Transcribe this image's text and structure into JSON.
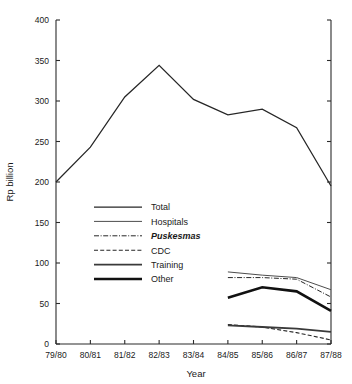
{
  "chart_data": {
    "type": "line",
    "title": "",
    "xlabel": "Year",
    "ylabel": "Rp billion",
    "ylim": [
      0,
      400
    ],
    "yticks": [
      0,
      50,
      100,
      150,
      200,
      250,
      300,
      350,
      400
    ],
    "ytick_labels": [
      "0",
      "50",
      "100",
      "150",
      "200",
      "250",
      "300",
      "350",
      "400"
    ],
    "categories": [
      "79/80",
      "80/81",
      "81/82",
      "82/83",
      "83/84",
      "84/85",
      "85/86",
      "86/87",
      "87/88"
    ],
    "grid": false,
    "legend_position": "center-left",
    "series": [
      {
        "name": "Total",
        "style": "solid-thin",
        "x": [
          "79/80",
          "80/81",
          "81/82",
          "82/83",
          "83/84",
          "84/85",
          "85/86",
          "86/87",
          "87/88"
        ],
        "values": [
          200,
          243,
          305,
          344,
          302,
          283,
          290,
          267,
          195
        ]
      },
      {
        "name": "Hospitals",
        "style": "solid-light",
        "x": [
          "84/85",
          "85/86",
          "86/87",
          "87/88"
        ],
        "values": [
          89,
          85,
          82,
          67
        ]
      },
      {
        "name": "Puskesmas",
        "style": "dash-dot",
        "italic": true,
        "x": [
          "84/85",
          "85/86",
          "86/87",
          "87/88"
        ],
        "values": [
          82,
          82,
          80,
          58
        ]
      },
      {
        "name": "CDC",
        "style": "dashed",
        "x": [
          "84/85",
          "85/86",
          "86/87",
          "87/88"
        ],
        "values": [
          24,
          21,
          14,
          5
        ]
      },
      {
        "name": "Training",
        "style": "solid-medium",
        "x": [
          "84/85",
          "85/86",
          "86/87",
          "87/88"
        ],
        "values": [
          23,
          21,
          19,
          15
        ]
      },
      {
        "name": "Other",
        "style": "solid-thick",
        "x": [
          "84/85",
          "85/86",
          "86/87",
          "87/88"
        ],
        "values": [
          57,
          70,
          65,
          41
        ]
      }
    ],
    "legend_entries": [
      {
        "label": "Total",
        "style": "solid-thin"
      },
      {
        "label": "Hospitals",
        "style": "solid-light"
      },
      {
        "label": "Puskesmas",
        "style": "dash-dot",
        "italic": true
      },
      {
        "label": "CDC",
        "style": "dashed"
      },
      {
        "label": "Training",
        "style": "solid-medium"
      },
      {
        "label": "Other",
        "style": "solid-thick"
      }
    ]
  }
}
